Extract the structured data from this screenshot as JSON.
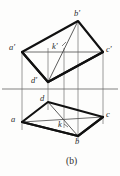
{
  "figure": {
    "caption": "(b)",
    "colors": {
      "ink": "#1a1a1a",
      "thin_line": "#6e6e6e",
      "paper": "#fdfdfc"
    },
    "stroke_widths": {
      "heavy": 2.1,
      "medium": 1.2,
      "thin": 0.7
    },
    "labels": [
      {
        "id": "b-prime",
        "text": "b'",
        "x": 74,
        "y": 9
      },
      {
        "id": "a-prime",
        "text": "a'",
        "x": 9,
        "y": 43
      },
      {
        "id": "c-prime",
        "text": "c'",
        "x": 106,
        "y": 45
      },
      {
        "id": "k-prime",
        "text": "k'",
        "x": 52,
        "y": 42
      },
      {
        "id": "d-prime",
        "text": "d'",
        "x": 31,
        "y": 76
      },
      {
        "id": "d",
        "text": "d",
        "x": 40,
        "y": 94
      },
      {
        "id": "a",
        "text": "a",
        "x": 11,
        "y": 115
      },
      {
        "id": "c",
        "text": "c",
        "x": 106,
        "y": 110
      },
      {
        "id": "k",
        "text": "k",
        "x": 58,
        "y": 120
      },
      {
        "id": "b",
        "text": "b",
        "x": 75,
        "y": 137
      }
    ],
    "points": {
      "frontal": {
        "a_prime": [
          22,
          52
        ],
        "b_prime": [
          78,
          21
        ],
        "c_prime": [
          103,
          52
        ],
        "d_prime": [
          48,
          82
        ],
        "k_prime": [
          62,
          48
        ]
      },
      "horizontal": {
        "a": [
          22,
          122
        ],
        "b": [
          78,
          136
        ],
        "c": [
          103,
          117
        ],
        "d": [
          48,
          102
        ],
        "k": [
          65,
          126
        ]
      }
    },
    "ground_line_y": 89,
    "projection_x": [
      22,
      48,
      78,
      103
    ]
  }
}
